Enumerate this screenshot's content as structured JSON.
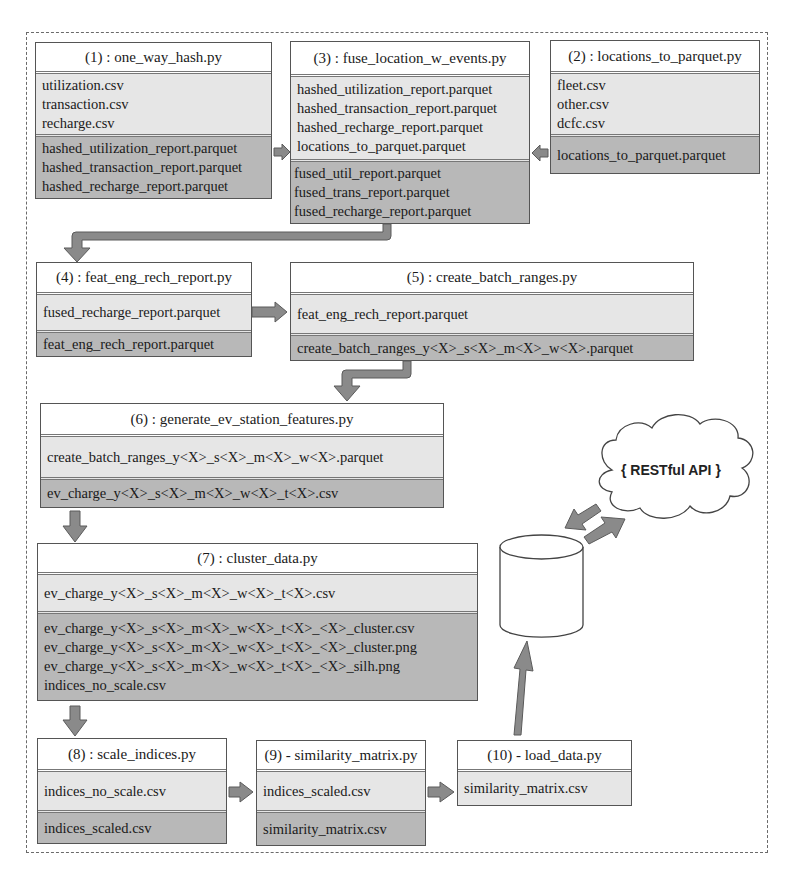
{
  "diagram": {
    "colors": {
      "title_bg": "#ffffff",
      "inputs_bg": "#e6e6e6",
      "outputs_bg": "#b8b8b8",
      "arrow_fill": "#8a8a8a",
      "border": "#555555"
    },
    "scripts": [
      {
        "id": "1",
        "title": "(1) : one_way_hash.py",
        "inputs": [
          "utilization.csv",
          "transaction.csv",
          "recharge.csv"
        ],
        "outputs": [
          "hashed_utilization_report.parquet",
          "hashed_transaction_report.parquet",
          "hashed_recharge_report.parquet"
        ]
      },
      {
        "id": "3",
        "title": "(3) : fuse_location_w_events.py",
        "inputs": [
          "hashed_utilization_report.parquet",
          "hashed_transaction_report.parquet",
          "hashed_recharge_report.parquet",
          "locations_to_parquet.parquet"
        ],
        "outputs": [
          "fused_util_report.parquet",
          "fused_trans_report.parquet",
          "fused_recharge_report.parquet"
        ]
      },
      {
        "id": "2",
        "title": "(2) : locations_to_parquet.py",
        "inputs": [
          "fleet.csv",
          "other.csv",
          "dcfc.csv"
        ],
        "outputs": [
          "locations_to_parquet.parquet"
        ]
      },
      {
        "id": "4",
        "title": "(4) : feat_eng_rech_report.py",
        "inputs": [
          "fused_recharge_report.parquet"
        ],
        "outputs": [
          "feat_eng_rech_report.parquet"
        ]
      },
      {
        "id": "5",
        "title": "(5) : create_batch_ranges.py",
        "inputs": [
          "feat_eng_rech_report.parquet"
        ],
        "outputs": [
          "create_batch_ranges_y<X>_s<X>_m<X>_w<X>.parquet"
        ]
      },
      {
        "id": "6",
        "title": "(6) : generate_ev_station_features.py",
        "inputs": [
          "create_batch_ranges_y<X>_s<X>_m<X>_w<X>.parquet"
        ],
        "outputs": [
          "ev_charge_y<X>_s<X>_m<X>_w<X>_t<X>.csv"
        ]
      },
      {
        "id": "7",
        "title": "(7) : cluster_data.py",
        "inputs": [
          "ev_charge_y<X>_s<X>_m<X>_w<X>_t<X>.csv"
        ],
        "outputs": [
          "ev_charge_y<X>_s<X>_m<X>_w<X>_t<X>_<X>_cluster.csv",
          "ev_charge_y<X>_s<X>_m<X>_w<X>_t<X>_<X>_cluster.png",
          "ev_charge_y<X>_s<X>_m<X>_w<X>_t<X>_<X>_silh.png",
          "indices_no_scale.csv"
        ]
      },
      {
        "id": "8",
        "title": "(8) : scale_indices.py",
        "inputs": [
          "indices_no_scale.csv"
        ],
        "outputs": [
          "indices_scaled.csv"
        ]
      },
      {
        "id": "9",
        "title": "(9) - similarity_matrix.py",
        "inputs": [
          "indices_scaled.csv"
        ],
        "outputs": [
          "similarity_matrix.csv"
        ]
      },
      {
        "id": "10",
        "title": "(10) - load_data.py",
        "inputs": [
          "similarity_matrix.csv"
        ],
        "outputs": []
      }
    ],
    "database": {
      "icon": "database-cylinder-icon"
    },
    "api": {
      "label": "{ RESTful API }",
      "icon": "cloud-icon"
    },
    "edges": [
      {
        "from": "1",
        "to": "3"
      },
      {
        "from": "2",
        "to": "3"
      },
      {
        "from": "3",
        "to": "4"
      },
      {
        "from": "4",
        "to": "5"
      },
      {
        "from": "5",
        "to": "6"
      },
      {
        "from": "6",
        "to": "7"
      },
      {
        "from": "7",
        "to": "8"
      },
      {
        "from": "8",
        "to": "9"
      },
      {
        "from": "9",
        "to": "10"
      },
      {
        "from": "10",
        "to": "database"
      },
      {
        "from": "database",
        "to": "api"
      },
      {
        "from": "api",
        "to": "database"
      }
    ]
  }
}
